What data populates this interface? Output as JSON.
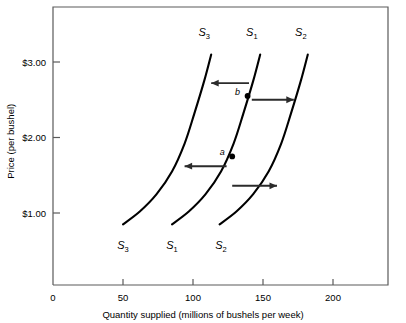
{
  "chart_data": {
    "type": "line",
    "title": "",
    "xlabel": "Quantity supplied (millions of bushels per week)",
    "ylabel": "Price (per bushel)",
    "xlim": [
      0,
      235
    ],
    "ylim": [
      0,
      3.6
    ],
    "grid": false,
    "legend_position": "inline-curve-labels",
    "xticks": [
      {
        "value": 0,
        "label": "0"
      },
      {
        "value": 50,
        "label": "50"
      },
      {
        "value": 100,
        "label": "100"
      },
      {
        "value": 150,
        "label": "150"
      },
      {
        "value": 200,
        "label": "200"
      }
    ],
    "yticks": [
      {
        "value": 1.0,
        "label": "$1.00"
      },
      {
        "value": 2.0,
        "label": "$2.00"
      },
      {
        "value": 3.0,
        "label": "$3.00"
      }
    ],
    "series": [
      {
        "name": "S3",
        "label_base": "S",
        "label_sub": "3",
        "description": "Supply curve shifted left (increase in supply cost / decrease in supply)",
        "points": [
          {
            "x": 50,
            "y": 0.85
          },
          {
            "x": 62,
            "y": 1.02
          },
          {
            "x": 74,
            "y": 1.25
          },
          {
            "x": 85,
            "y": 1.55
          },
          {
            "x": 94,
            "y": 1.92
          },
          {
            "x": 101,
            "y": 2.32
          },
          {
            "x": 108,
            "y": 2.75
          },
          {
            "x": 113,
            "y": 3.1
          }
        ]
      },
      {
        "name": "S1",
        "label_base": "S",
        "label_sub": "1",
        "description": "Original supply curve passing through points a and b",
        "points": [
          {
            "x": 85,
            "y": 0.85
          },
          {
            "x": 97,
            "y": 1.02
          },
          {
            "x": 109,
            "y": 1.25
          },
          {
            "x": 120,
            "y": 1.55
          },
          {
            "x": 129,
            "y": 1.92
          },
          {
            "x": 136,
            "y": 2.32
          },
          {
            "x": 143,
            "y": 2.75
          },
          {
            "x": 148,
            "y": 3.1
          }
        ]
      },
      {
        "name": "S2",
        "label_base": "S",
        "label_sub": "2",
        "description": "Supply curve shifted right (increase in supply)",
        "points": [
          {
            "x": 119,
            "y": 0.85
          },
          {
            "x": 131,
            "y": 1.02
          },
          {
            "x": 143,
            "y": 1.25
          },
          {
            "x": 154,
            "y": 1.55
          },
          {
            "x": 163,
            "y": 1.92
          },
          {
            "x": 170,
            "y": 2.32
          },
          {
            "x": 177,
            "y": 2.75
          },
          {
            "x": 182,
            "y": 3.1
          }
        ]
      }
    ],
    "annotations": [
      {
        "name": "point-a",
        "label": "a",
        "x": 128,
        "y": 1.75,
        "on_series": "S1"
      },
      {
        "name": "point-b",
        "label": "b",
        "x": 139,
        "y": 2.55,
        "on_series": "S1"
      }
    ],
    "arrows": [
      {
        "name": "arrow-b-left",
        "direction": "left",
        "x_from": 140,
        "x_to": 113,
        "y": 2.72
      },
      {
        "name": "arrow-b-right",
        "direction": "right",
        "x_from": 142,
        "x_to": 172,
        "y": 2.5
      },
      {
        "name": "arrow-a-left",
        "direction": "left",
        "x_from": 124,
        "x_to": 94,
        "y": 1.62
      },
      {
        "name": "arrow-a-right",
        "direction": "right",
        "x_from": 128,
        "x_to": 160,
        "y": 1.36
      }
    ],
    "curve_top_labels": [
      {
        "name": "S3",
        "base": "S",
        "sub": "3",
        "x": 108,
        "y": 3.35
      },
      {
        "name": "S1",
        "base": "S",
        "sub": "1",
        "x": 142,
        "y": 3.35
      },
      {
        "name": "S2",
        "base": "S",
        "sub": "2",
        "x": 177,
        "y": 3.35
      }
    ],
    "curve_bottom_labels": [
      {
        "name": "S3",
        "base": "S",
        "sub": "3",
        "x": 50,
        "y": 0.52
      },
      {
        "name": "S1",
        "base": "S",
        "sub": "1",
        "x": 85,
        "y": 0.52
      },
      {
        "name": "S2",
        "base": "S",
        "sub": "2",
        "x": 120,
        "y": 0.52
      }
    ]
  },
  "axes": {
    "x_title": "Quantity supplied (millions of bushels per week)",
    "y_title": "Price (per bushel)"
  },
  "colors": {
    "curve": "#000000",
    "arrow": "#2b2b2b",
    "frame": "#5a5a5a",
    "background": "#ffffff"
  }
}
